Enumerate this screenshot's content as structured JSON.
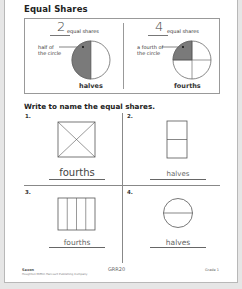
{
  "page": {
    "title": "Equal Shares",
    "example": {
      "left": {
        "number": "2",
        "number_label": "equal shares",
        "callout_line1": "half of",
        "callout_line2": "the circle",
        "answer": "halves",
        "shape": "circle-halves",
        "shaded_parts": 1,
        "shade_color": "#7a7a7a"
      },
      "right": {
        "number": "4",
        "number_label": "equal shares",
        "callout_line1": "a fourth of",
        "callout_line2": "the circle",
        "answer": "fourths",
        "shape": "circle-fourths",
        "shaded_parts": 1,
        "shade_color": "#7a7a7a"
      }
    },
    "instruction": "Write to name the equal shares.",
    "problems": [
      {
        "number": "1.",
        "shape": "square-diagonals-fourths",
        "answer": "fourths"
      },
      {
        "number": "2.",
        "shape": "rectangle-horizontal-halves",
        "answer": "halves"
      },
      {
        "number": "3.",
        "shape": "rectangle-vertical-fourths",
        "answer": "fourths"
      },
      {
        "number": "4.",
        "shape": "circle-halves",
        "answer": "halves"
      }
    ],
    "footer": {
      "left_line1": "Saxon",
      "left_line2": "Houghton Mifflin Harcourt Publishing Company",
      "center": "GRR20",
      "right": "Grade 1"
    }
  }
}
